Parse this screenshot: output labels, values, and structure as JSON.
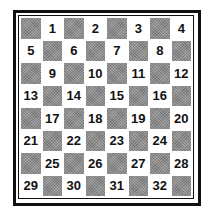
{
  "board": {
    "rows": 8,
    "cols": 8,
    "first_square_dark": true,
    "numbering": "light squares numbered 1-32, left to right, top to bottom",
    "squares": [
      [
        "",
        "1",
        "",
        "2",
        "",
        "3",
        "",
        "4"
      ],
      [
        "5",
        "",
        "6",
        "",
        "7",
        "",
        "8",
        ""
      ],
      [
        "",
        "9",
        "",
        "10",
        "",
        "11",
        "",
        "12"
      ],
      [
        "13",
        "",
        "14",
        "",
        "15",
        "",
        "16",
        ""
      ],
      [
        "",
        "17",
        "",
        "18",
        "",
        "19",
        "",
        "20"
      ],
      [
        "21",
        "",
        "22",
        "",
        "23",
        "",
        "24",
        ""
      ],
      [
        "",
        "25",
        "",
        "26",
        "",
        "27",
        "",
        "28"
      ],
      [
        "29",
        "",
        "30",
        "",
        "31",
        "",
        "32",
        ""
      ]
    ],
    "colors": {
      "dark_square": "#8f8f8f",
      "light_square": "#ffffff",
      "border": "#111111",
      "number_text": "#111111"
    }
  }
}
